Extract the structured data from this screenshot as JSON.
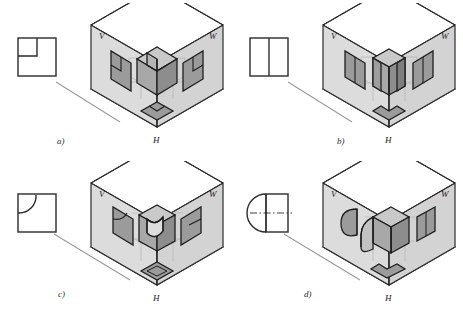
{
  "figure": {
    "background_color": "#ffffff",
    "line_color": "#2b2b2b",
    "leader_line_color": "#9a9a9a"
  },
  "plane_labels": {
    "vertical": "V",
    "profile": "W",
    "horizontal": "H"
  },
  "palette": {
    "plane_v_fill": "#dcdcdc",
    "plane_w_fill": "#d2d2d2",
    "plane_h_fill": "#e8e8e8",
    "solid_top_fill": "#c9c9c9",
    "solid_left_fill": "#a8a8a8",
    "solid_right_fill": "#8d8d8d",
    "projection_fill": "#9b9b9b",
    "outline": "#262626",
    "thin_line": "#b5b5b5"
  },
  "panels": [
    {
      "id": "a",
      "caption": "a)",
      "shape_name": "square-with-corner-notch",
      "shape_description": "Square outline with a small square notch removed from the upper-left corner",
      "solid_description": "Cube with a cubic corner notch removed",
      "views": {
        "front": "square with corner notch",
        "side": "square with corner notch",
        "top": "square with corner notch"
      }
    },
    {
      "id": "b",
      "caption": "b)",
      "shape_name": "square-split-vertically",
      "shape_description": "Square outline divided into two equal halves by a vertical line",
      "solid_description": "Two adjoining rectangular prisms forming an L-shaped block",
      "views": {
        "front": "two rectangles side by side",
        "side": "two rectangles side by side",
        "top": "L-shaped outline"
      }
    },
    {
      "id": "c",
      "caption": "c)",
      "shape_name": "square-with-quarter-arc",
      "shape_description": "Square outline with a quarter-circle arc cut at the upper-left corner",
      "solid_description": "Rectangular block with a quarter-cylindrical groove",
      "views": {
        "front": "square with quarter arc",
        "side": "square with diagonal edges",
        "top": "square with inner square"
      }
    },
    {
      "id": "d",
      "caption": "d)",
      "shape_name": "square-with-semicircle",
      "shape_description": "Square outline with a semicircle on the left side and a horizontal dash-dot centre line",
      "solid_description": "Rectangular block with a half-cylinder attached on one side",
      "views": {
        "front": "semicircle plus rectangle",
        "side": "rectangle",
        "top": "L-shaped outline"
      }
    }
  ]
}
